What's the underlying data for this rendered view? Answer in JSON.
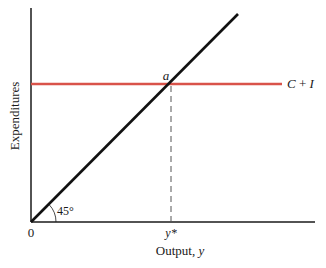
{
  "diagram": {
    "type": "keynesian-cross",
    "y_axis_label": "Expenditures",
    "x_axis_label": "Output, ",
    "x_axis_var": "y",
    "origin_label": "0",
    "angle_label": "45°",
    "equilibrium_point_label": "a",
    "equilibrium_output_label": "y*",
    "horizontal_line_label": "C + I",
    "colors": {
      "axes": "#1a1a1a",
      "diagonal": "#111111",
      "expenditure_line": "#d9534a",
      "dashed": "#555555"
    }
  }
}
